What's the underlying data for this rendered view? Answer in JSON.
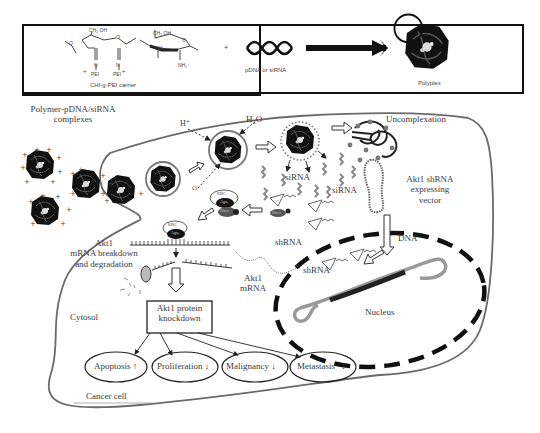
{
  "top_panel": {
    "carrier_label": "CHI-g-PEI carrier",
    "chem": {
      "ch2oh_1": "CH₂ OH",
      "ch2oh_2": "CH₂ OH",
      "oh": "OH",
      "nh2": "NH₂",
      "pei_1": "PEI",
      "pei_2": "PEI",
      "h": "H",
      "n": "N",
      "o": "O"
    },
    "plus_sign": "+",
    "nucleic_label": "pDNA or siRNA",
    "product_label": "Polyplex"
  },
  "cell": {
    "complexes_label": "Polymer-pDNA/siRNA complexes",
    "complexes_line1": "Polymer-pDNA/siRNA",
    "complexes_line2": "complexes",
    "proton_label": "H⁺",
    "water_label": "H₂O",
    "chloride_label": "Cl⁻",
    "uncomplexation_label": "Uncomplexation",
    "sirna_label_1": "siRNA",
    "sirna_label_2": "siRNA",
    "vector_label_line1": "Akt1 shRNA",
    "vector_label_line2": "expressing",
    "vector_label_line3": "vector",
    "risc_label_1": "RISC",
    "ago_label_1": "Ago₂",
    "dicer_label": "Dicer",
    "risc_label_2": "RISC",
    "ago_label_2": "Ago₂",
    "dicer_label_2": "Dicer",
    "shrna_label_1": "shRNA",
    "shrna_label_2": "shRNA",
    "dna_label": "DNA",
    "nucleus_label": "Nucleus",
    "mrna_breakdown_line1": "Akt1",
    "mrna_breakdown_line2": "mRNA breakdown",
    "mrna_breakdown_line3": "and degradation",
    "akt1_mrna_line1": "Akt1",
    "akt1_mrna_line2": "mRNA",
    "cytosol_label": "Cytosol",
    "knockdown_line1": "Akt1 protein",
    "knockdown_line2": "knockdown",
    "cancer_cell_label": "Cancer cell"
  },
  "outcomes": [
    {
      "label": "Apoptosis",
      "direction": "up"
    },
    {
      "label": "Proliferation",
      "direction": "down"
    },
    {
      "label": "Malignancy",
      "direction": "down"
    },
    {
      "label": "Metastasis",
      "direction": "down"
    }
  ],
  "colors": {
    "membrane": "#6a6a6a",
    "ink": "#111111",
    "nucleus_dash": "#111111",
    "text": "#3a3a3a"
  }
}
